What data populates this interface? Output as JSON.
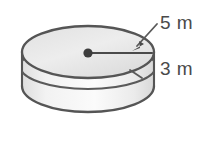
{
  "figure": {
    "kind": "cylinder-geometry-diagram",
    "shape_name": "cylinder",
    "colors": {
      "background": "#ffffff",
      "body_fill": "#e9e9e9",
      "top_face_fill": "#e4e4e4",
      "inner_wall_fill": "#efefef",
      "outline": "#555555",
      "rim_line": "#5a5a5a",
      "dot": "#3d3d3d",
      "leader_line": "#5a5a5a",
      "text": "#4a4a4a"
    },
    "labels": {
      "radius": "5 m",
      "height": "3 m"
    },
    "measurements": [
      {
        "name": "radius",
        "value": 5,
        "unit": "m",
        "text": "5 m",
        "points_to": "top-face-radius-segment"
      },
      {
        "name": "height",
        "value": 3,
        "unit": "m",
        "text": "3 m",
        "points_to": "cylinder-side-height"
      }
    ],
    "annotations": {
      "radius_arrow": "arrow pointing down-left from the 5 m label to the end of the radius segment",
      "center_dot": "filled dot at the centre of the top face"
    }
  }
}
